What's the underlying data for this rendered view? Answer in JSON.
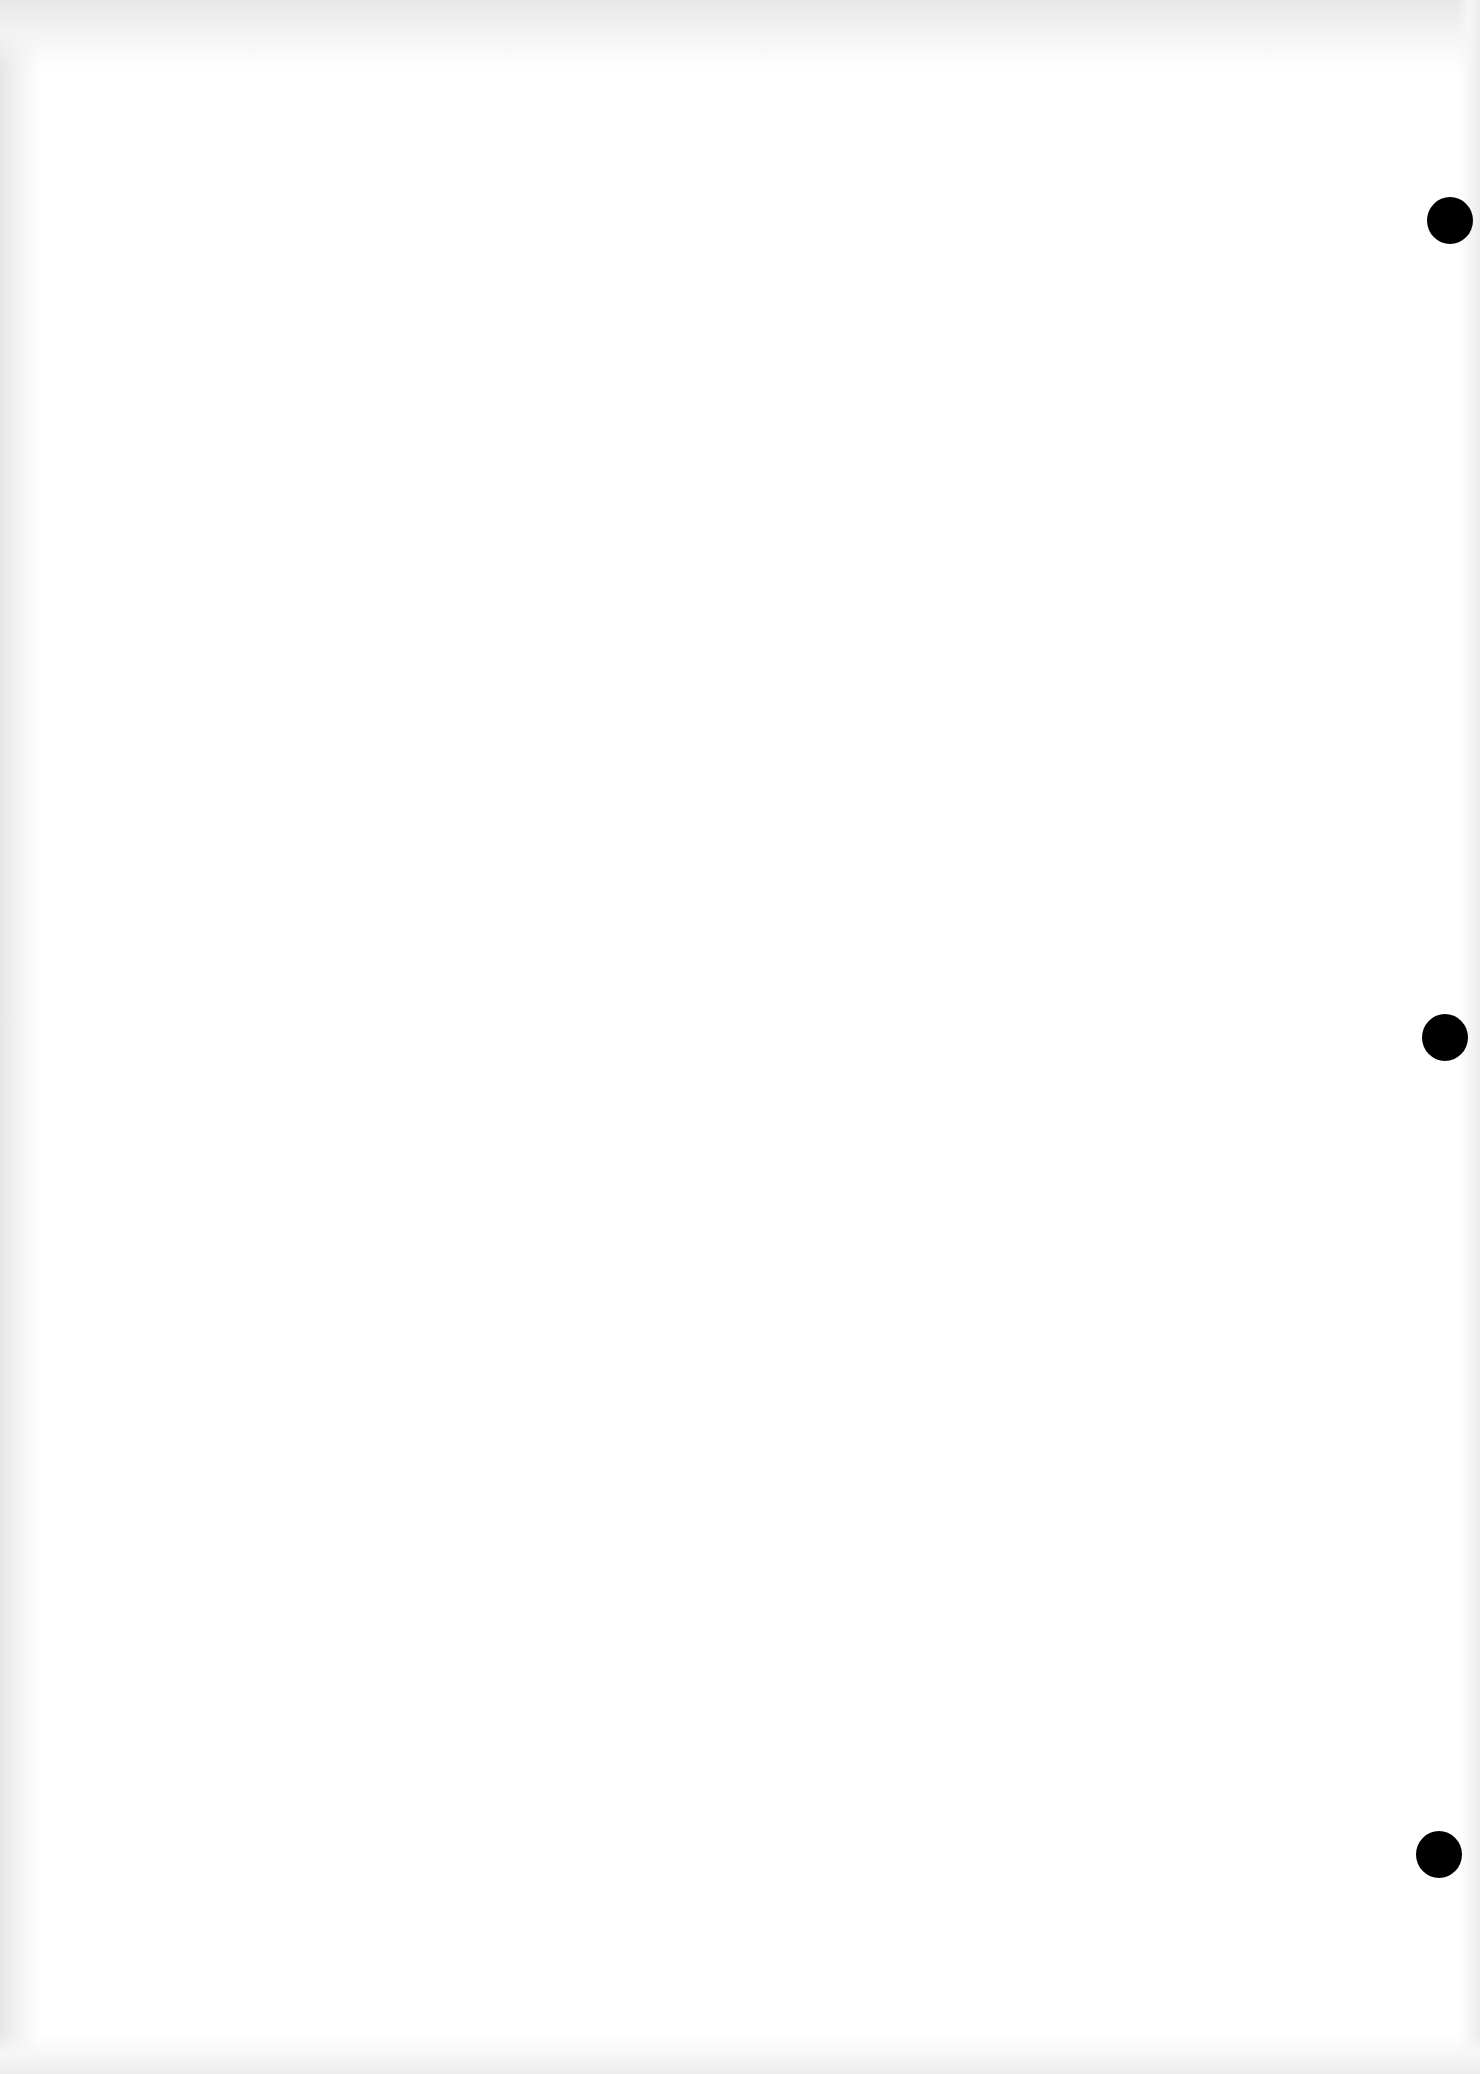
{
  "document": {
    "background_color": "#ffffff",
    "text_content": "",
    "punch_holes": [
      {
        "cx": 1450,
        "cy": 220,
        "w": 46,
        "h": 47,
        "color": "#000000"
      },
      {
        "cx": 1445,
        "cy": 1037,
        "w": 46,
        "h": 47,
        "color": "#000000"
      },
      {
        "cx": 1439,
        "cy": 1854,
        "w": 46,
        "h": 47,
        "color": "#000000"
      }
    ]
  }
}
